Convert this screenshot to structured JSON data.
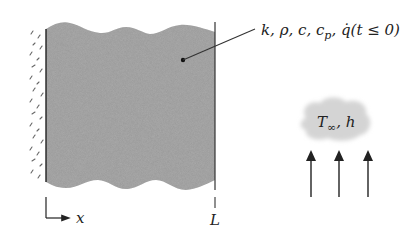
{
  "figure": {
    "type": "plane-wall-transient-conduction",
    "slab": {
      "fill_color": "#9a9a9a",
      "properties_label": "k, ρ, c",
      "cp_subscript": "p",
      "generation_label": "q̇(t ≤ 0)",
      "separator": ", "
    },
    "left_boundary": {
      "description": "insulated",
      "hatch_color": "#555555"
    },
    "right_boundary": {
      "label": "L"
    },
    "axis": {
      "label": "x"
    },
    "convection": {
      "fluid_label_T": "T",
      "fluid_label_sub": "∞",
      "fluid_label_h": ", h",
      "cloud_color": "#d4d4d4",
      "arrow_count": 3
    }
  }
}
